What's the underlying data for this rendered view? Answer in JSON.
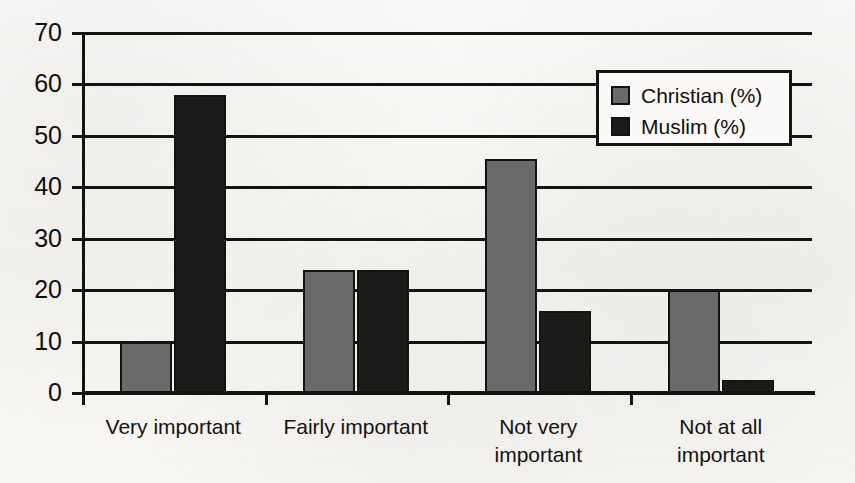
{
  "chart_data": {
    "type": "bar",
    "title": "",
    "subtitle": "",
    "xlabel": "",
    "ylabel": "",
    "ylim": [
      0,
      70
    ],
    "ytick_step": 10,
    "yticks": [
      0,
      10,
      20,
      30,
      40,
      50,
      60,
      70
    ],
    "ytick_labels": [
      "0",
      "10",
      "20",
      "30",
      "40",
      "50",
      "60",
      "70"
    ],
    "grid": true,
    "grid_axis": "y",
    "legend_position": "top-right",
    "categories": [
      "Very important",
      "Fairly important",
      "Not very important",
      "Not at all important"
    ],
    "category_label_lines": [
      [
        "Very important"
      ],
      [
        "Fairly important"
      ],
      [
        "Not very",
        "important"
      ],
      [
        "Not at all",
        "important"
      ]
    ],
    "series": [
      {
        "name": "Christian (%)",
        "color": "#6a6a6a",
        "values": [
          10,
          24,
          45.5,
          20
        ]
      },
      {
        "name": "Muslim (%)",
        "color": "#1d1c1a",
        "values": [
          58,
          24,
          16,
          2.5
        ]
      }
    ]
  },
  "legend": {
    "entries": [
      {
        "label": "Christian (%)",
        "swatch": "series-christian"
      },
      {
        "label": "Muslim (%)",
        "swatch": "series-muslim"
      }
    ]
  },
  "colors": {
    "series_christian": "#6a6a6a",
    "series_muslim": "#1d1c1a",
    "axis": "#15130f",
    "grid": "#15130f",
    "background": "#f7f6f3",
    "text": "#120f0c"
  }
}
